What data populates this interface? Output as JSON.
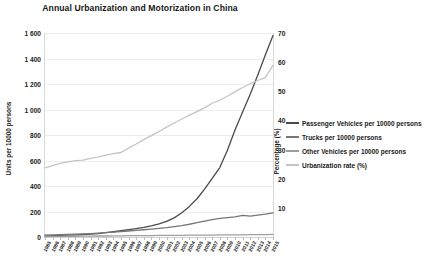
{
  "chart_data": {
    "type": "line",
    "title": "Annual Urbanization and Motorization in China",
    "xlabel": "",
    "ylabel": "Units per 10000 persons",
    "y2label": "Percentage (%)",
    "ylim": [
      0,
      1600
    ],
    "y2lim": [
      0,
      70
    ],
    "yticks": [
      "0",
      "200",
      "400",
      "600",
      "800",
      "1 000",
      "1 200",
      "1 400",
      "1 600"
    ],
    "ytick_values": [
      0,
      200,
      400,
      600,
      800,
      1000,
      1200,
      1400,
      1600
    ],
    "y2ticks": [
      "10",
      "20",
      "30",
      "40",
      "50",
      "60",
      "70"
    ],
    "y2tick_values": [
      10,
      20,
      30,
      40,
      50,
      60,
      70
    ],
    "grid": true,
    "legend_position": "right",
    "categories": [
      "1985",
      "1986",
      "1987",
      "1988",
      "1989",
      "1990",
      "1991",
      "1992",
      "1993",
      "1994",
      "1995",
      "1996",
      "1997",
      "1998",
      "1999",
      "2000",
      "2001",
      "2002",
      "2003",
      "2004",
      "2005",
      "2006",
      "2007",
      "2008",
      "2009",
      "2010",
      "2011",
      "2012",
      "2013",
      "2014",
      "2015"
    ],
    "series": [
      {
        "name": "Passenger Vehicles per 10000 persons",
        "axis": "left",
        "color": "#4a4a4a",
        "values": [
          8,
          10,
          12,
          15,
          17,
          19,
          22,
          27,
          34,
          41,
          49,
          57,
          66,
          76,
          88,
          103,
          122,
          150,
          190,
          240,
          300,
          375,
          460,
          545,
          680,
          840,
          980,
          1120,
          1270,
          1430,
          1580
        ]
      },
      {
        "name": "Trucks per 10000 persons",
        "axis": "left",
        "color": "#767676",
        "values": [
          14,
          16,
          18,
          20,
          22,
          24,
          27,
          30,
          34,
          38,
          43,
          47,
          52,
          57,
          62,
          68,
          74,
          82,
          90,
          100,
          112,
          124,
          136,
          146,
          152,
          158,
          170,
          164,
          172,
          180,
          190
        ]
      },
      {
        "name": "Other Vehicles per 10000 persons",
        "axis": "left",
        "color": "#9e9e9e",
        "values": [
          4,
          5,
          5,
          6,
          6,
          7,
          7,
          8,
          8,
          9,
          9,
          10,
          10,
          11,
          11,
          12,
          12,
          13,
          13,
          14,
          14,
          15,
          15,
          16,
          16,
          17,
          17,
          18,
          18,
          19,
          20
        ]
      },
      {
        "name": "Urbanization rate (%)",
        "axis": "right",
        "color": "#c4c4c4",
        "values": [
          23.7,
          24.5,
          25.3,
          25.8,
          26.2,
          26.4,
          27.0,
          27.5,
          28.1,
          28.6,
          29.0,
          30.5,
          31.9,
          33.4,
          34.8,
          36.2,
          37.7,
          39.1,
          40.5,
          41.8,
          43.0,
          44.3,
          45.9,
          47.0,
          48.3,
          49.9,
          51.3,
          52.6,
          53.7,
          54.8,
          58.9
        ]
      }
    ]
  },
  "legend": {
    "items": [
      {
        "label": "Passenger Vehicles per 10000 persons",
        "color": "#4a4a4a"
      },
      {
        "label": "Trucks per 10000 persons",
        "color": "#767676"
      },
      {
        "label": "Other Vehicles per 10000 persons",
        "color": "#9e9e9e"
      },
      {
        "label": "Urbanization rate (%)",
        "color": "#c4c4c4"
      }
    ]
  }
}
